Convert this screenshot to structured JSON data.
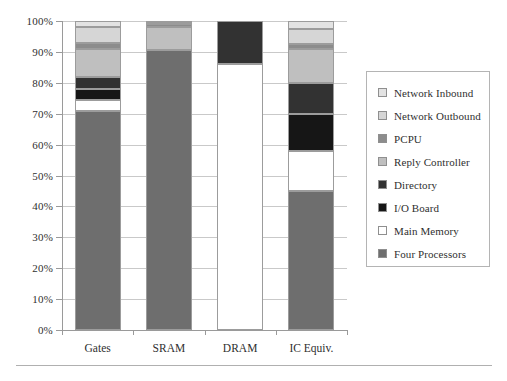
{
  "chart_data": {
    "type": "bar",
    "subtype": "stacked-bar-100-percent",
    "title": "",
    "xlabel": "",
    "ylabel": "",
    "ylim": [
      0,
      100
    ],
    "ytick_labels": [
      "100%",
      "90%",
      "80%",
      "70%",
      "60%",
      "50%",
      "40%",
      "30%",
      "20%",
      "10%",
      "0%"
    ],
    "ytick_values": [
      100,
      90,
      80,
      70,
      60,
      50,
      40,
      30,
      20,
      10,
      0
    ],
    "grid": true,
    "legend_position": "right",
    "categories": [
      "Gates",
      "SRAM",
      "DRAM",
      "IC Equiv."
    ],
    "stack_order_bottom_to_top": [
      "Four Processors",
      "Main Memory",
      "I/O Board",
      "Directory",
      "Reply Controller",
      "PCPU",
      "Network Outbound",
      "Network Inbound"
    ],
    "series": [
      {
        "name": "Four Processors",
        "color": "#6e6e6e",
        "values": [
          71.0,
          90.5,
          0.0,
          45.0
        ]
      },
      {
        "name": "Main Memory",
        "color": "#ffffff",
        "values": [
          3.5,
          0.0,
          86.0,
          13.0
        ]
      },
      {
        "name": "I/O Board",
        "color": "#161616",
        "values": [
          3.5,
          0.0,
          0.0,
          12.0
        ]
      },
      {
        "name": "Directory",
        "color": "#323232",
        "values": [
          4.0,
          0.0,
          14.0,
          10.0
        ]
      },
      {
        "name": "Reply Controller",
        "color": "#bfbfbf",
        "values": [
          9.0,
          7.5,
          0.0,
          11.0
        ]
      },
      {
        "name": "PCPU",
        "color": "#8c8c8c",
        "values": [
          2.0,
          1.0,
          0.0,
          1.5
        ]
      },
      {
        "name": "Network Outbound",
        "color": "#d6d6d6",
        "values": [
          5.0,
          0.5,
          0.0,
          5.0
        ]
      },
      {
        "name": "Network Inbound",
        "color": "#e3e3e3",
        "values": [
          2.0,
          0.5,
          0.0,
          2.5
        ]
      }
    ]
  },
  "legend": {
    "items": [
      {
        "label": "Network Inbound",
        "color": "#e3e3e3"
      },
      {
        "label": "Network Outbound",
        "color": "#d6d6d6"
      },
      {
        "label": "PCPU",
        "color": "#8c8c8c"
      },
      {
        "label": "Reply Controller",
        "color": "#bfbfbf"
      },
      {
        "label": "Directory",
        "color": "#323232"
      },
      {
        "label": "I/O Board",
        "color": "#161616"
      },
      {
        "label": "Main Memory",
        "color": "#ffffff"
      },
      {
        "label": "Four Processors",
        "color": "#6e6e6e"
      }
    ]
  },
  "style": {
    "grid_color": "#c9c9c9",
    "axis_color": "#9a9a9a",
    "bar_outline": "#9c9c9c",
    "text_color": "#2f2f2f",
    "background": "#ffffff"
  }
}
